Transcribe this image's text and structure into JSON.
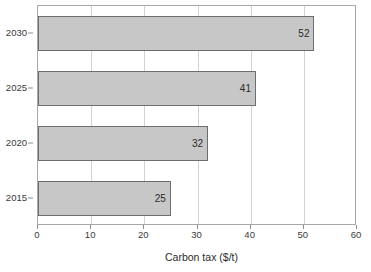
{
  "chart_data": {
    "type": "bar",
    "orientation": "horizontal",
    "title": "",
    "subtitle": "",
    "xlabel": "Carbon tax ($/t)",
    "ylabel": "",
    "categories": [
      "2030",
      "2025",
      "2020",
      "2015"
    ],
    "values": [
      52,
      41,
      32,
      25
    ],
    "data_labels": [
      "52",
      "41",
      "32",
      "25"
    ],
    "xlim": [
      0,
      60
    ],
    "xticks": [
      0,
      10,
      20,
      30,
      40,
      50,
      60
    ],
    "xtick_labels": [
      "0",
      "10",
      "20",
      "30",
      "40",
      "50",
      "60"
    ],
    "ytick_labels": [
      "2030",
      "2025",
      "2020",
      "2015"
    ],
    "grid": "vertical",
    "legend": "none",
    "series": [
      {
        "name": "Carbon tax",
        "categories": [
          "2030",
          "2025",
          "2020",
          "2015"
        ],
        "values": [
          52,
          41,
          32,
          25
        ]
      }
    ],
    "colors": {
      "bar_fill": "#c7c7c7",
      "bar_border": "#6e6e6e",
      "gridline": "#d2d2d2",
      "frame": "#a8a8a8",
      "text": "#3a3a3a",
      "background": "#ffffff"
    }
  }
}
